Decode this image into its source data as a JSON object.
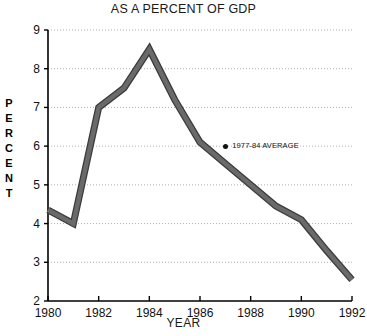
{
  "chart_data": {
    "type": "line",
    "title": "AS A PERCENT OF GDP",
    "xlabel": "YEAR",
    "ylabel": "PERCENT",
    "xlim": [
      1980,
      1992
    ],
    "ylim": [
      2,
      9
    ],
    "grid": true,
    "legend_position": "inline-annotation",
    "x_tick_labels": [
      "1980",
      "1982",
      "1984",
      "1986",
      "1988",
      "1990",
      "1992"
    ],
    "x_ticks": [
      1980,
      1982,
      1984,
      1986,
      1988,
      1990,
      1992
    ],
    "y_tick_labels": [
      "9",
      "8",
      "7",
      "6",
      "5",
      "4",
      "3",
      "2"
    ],
    "y_ticks": [
      9,
      8,
      7,
      6,
      5,
      4,
      3,
      2
    ],
    "series": [
      {
        "name": "Percent of GDP",
        "color": "#6a6a6a",
        "x": [
          1980,
          1981,
          1982,
          1983,
          1984,
          1985,
          1986,
          1987,
          1988,
          1989,
          1990,
          1991,
          1992
        ],
        "values": [
          4.35,
          4.0,
          7.0,
          7.5,
          8.5,
          7.2,
          6.1,
          5.55,
          5.0,
          4.45,
          4.1,
          3.3,
          2.55
        ]
      }
    ],
    "annotations": [
      {
        "text": "1977-84 AVERAGE",
        "marker": "filled-circle",
        "x": 1987,
        "y": 6.0
      }
    ]
  },
  "ylabel_letters": [
    "P",
    "E",
    "R",
    "C",
    "E",
    "N",
    "T"
  ]
}
